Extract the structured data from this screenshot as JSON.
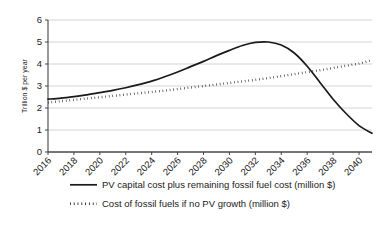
{
  "chart_data": {
    "type": "line",
    "title": "",
    "xlabel": "",
    "ylabel": "Trillion $ per year",
    "xlim": [
      2016,
      2041
    ],
    "ylim": [
      0,
      6
    ],
    "grid": true,
    "grid_axis": "y",
    "legend_position": "bottom",
    "xticks": [
      "2016",
      "2018",
      "2020",
      "2022",
      "2024",
      "2026",
      "2028",
      "2030",
      "2032",
      "2034",
      "2036",
      "2038",
      "2040"
    ],
    "yticks": [
      "0",
      "1",
      "2",
      "3",
      "4",
      "5",
      "6"
    ],
    "x": [
      2016,
      2017,
      2018,
      2019,
      2020,
      2021,
      2022,
      2023,
      2024,
      2025,
      2026,
      2027,
      2028,
      2029,
      2030,
      2031,
      2032,
      2033,
      2034,
      2035,
      2036,
      2037,
      2038,
      2039,
      2040,
      2041
    ],
    "series": [
      {
        "name": "PV capital cost plus remaining fossil fuel cost (million $)",
        "style": "solid",
        "color": "#1a1a1a",
        "values": [
          2.4,
          2.45,
          2.52,
          2.6,
          2.7,
          2.8,
          2.92,
          3.06,
          3.22,
          3.42,
          3.64,
          3.88,
          4.12,
          4.38,
          4.62,
          4.84,
          4.98,
          5.0,
          4.86,
          4.5,
          3.9,
          3.15,
          2.4,
          1.75,
          1.2,
          0.85
        ]
      },
      {
        "name": "Cost of fossil fuels if no PV growth (million $)",
        "style": "dotted",
        "color": "#1a1a1a",
        "values": [
          2.25,
          2.31,
          2.37,
          2.43,
          2.49,
          2.55,
          2.61,
          2.67,
          2.73,
          2.79,
          2.86,
          2.93,
          3.0,
          3.07,
          3.14,
          3.21,
          3.28,
          3.36,
          3.45,
          3.54,
          3.63,
          3.72,
          3.82,
          3.92,
          4.02,
          4.18
        ]
      }
    ]
  },
  "legend": {
    "items": [
      {
        "label": "PV capital cost plus remaining fossil fuel cost (million $)",
        "style": "solid"
      },
      {
        "label": "Cost of fossil fuels if no PV growth (million $)",
        "style": "dotted"
      }
    ]
  },
  "axes": {
    "y_axis_title": "Trillion $ per year"
  }
}
